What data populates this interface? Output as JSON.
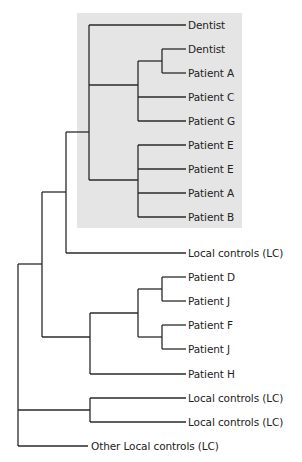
{
  "diagram": {
    "type": "dendrogram",
    "highlight_box": {
      "x": 77,
      "y": 13,
      "width": 165,
      "height": 215,
      "color": "#e5e5e5"
    },
    "label_offset_x": 188,
    "leaf_end_x": 186,
    "leaves": [
      {
        "label": "Dentist",
        "y": 25
      },
      {
        "label": "Dentist",
        "y": 49
      },
      {
        "label": "Patient A",
        "y": 73
      },
      {
        "label": "Patient C",
        "y": 97
      },
      {
        "label": "Patient G",
        "y": 121
      },
      {
        "label": "Patient E",
        "y": 145
      },
      {
        "label": "Patient E",
        "y": 169
      },
      {
        "label": "Patient A",
        "y": 193
      },
      {
        "label": "Patient B",
        "y": 217
      },
      {
        "label": "Local controls (LC)",
        "y": 253
      },
      {
        "label": "Patient D",
        "y": 277
      },
      {
        "label": "Patient J",
        "y": 301
      },
      {
        "label": "Patient F",
        "y": 325
      },
      {
        "label": "Patient J",
        "y": 349
      },
      {
        "label": "Patient H",
        "y": 374
      },
      {
        "label": "Local controls (LC)",
        "y": 398
      },
      {
        "label": "Local controls (LC)",
        "y": 422
      },
      {
        "label": "Other Local controls (LC)",
        "y": 446,
        "end_x": 88,
        "label_x": 91
      }
    ],
    "lines": [
      [
        162,
        49,
        162,
        73
      ],
      [
        162,
        49,
        186,
        49
      ],
      [
        162,
        73,
        186,
        73
      ],
      [
        138,
        61,
        162,
        61
      ],
      [
        138,
        61,
        138,
        121
      ],
      [
        138,
        97,
        186,
        97
      ],
      [
        138,
        121,
        186,
        121
      ],
      [
        89,
        85,
        138,
        85
      ],
      [
        89,
        25,
        89,
        180
      ],
      [
        89,
        25,
        186,
        25
      ],
      [
        138,
        145,
        138,
        217
      ],
      [
        138,
        145,
        186,
        145
      ],
      [
        138,
        169,
        186,
        169
      ],
      [
        138,
        193,
        186,
        193
      ],
      [
        138,
        217,
        186,
        217
      ],
      [
        89,
        180,
        138,
        180
      ],
      [
        66,
        132,
        89,
        132
      ],
      [
        66,
        132,
        66,
        253
      ],
      [
        66,
        253,
        186,
        253
      ],
      [
        42,
        192,
        66,
        192
      ],
      [
        162,
        277,
        162,
        301
      ],
      [
        162,
        277,
        186,
        277
      ],
      [
        162,
        301,
        186,
        301
      ],
      [
        162,
        325,
        162,
        349
      ],
      [
        162,
        325,
        186,
        325
      ],
      [
        162,
        349,
        186,
        349
      ],
      [
        138,
        289,
        162,
        289
      ],
      [
        138,
        337,
        162,
        337
      ],
      [
        138,
        289,
        138,
        337
      ],
      [
        90,
        313,
        138,
        313
      ],
      [
        90,
        313,
        90,
        374
      ],
      [
        90,
        374,
        186,
        374
      ],
      [
        42,
        337,
        90,
        337
      ],
      [
        42,
        192,
        42,
        337
      ],
      [
        18,
        264,
        42,
        264
      ],
      [
        90,
        398,
        90,
        422
      ],
      [
        90,
        398,
        186,
        398
      ],
      [
        90,
        422,
        186,
        422
      ],
      [
        18,
        410,
        90,
        410
      ],
      [
        18,
        264,
        18,
        446
      ],
      [
        18,
        446,
        88,
        446
      ]
    ]
  }
}
